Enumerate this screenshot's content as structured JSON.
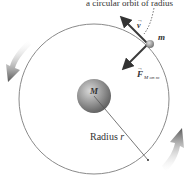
{
  "diagram": {
    "caption_fragment": "a circular orbit of radius",
    "central_mass_label": "M",
    "orbiting_mass_label": "m",
    "velocity_label": "v",
    "force_label": "F",
    "force_subscript": "M on m",
    "radius_label": "Radius",
    "radius_symbol": "r",
    "colors": {
      "orbit": "#8a8a8a",
      "vector": "#3a3a3a",
      "sphere": "#8c8c8c",
      "motion_arrow": "#6a6a6a"
    }
  }
}
